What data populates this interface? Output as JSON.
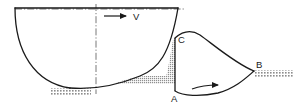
{
  "figure": {
    "labels": {
      "velocity": "V",
      "point_a": "A",
      "point_b": "B",
      "point_c": "C"
    },
    "colors": {
      "stroke": "#1a1a1a",
      "hatch": "#8c8c8c",
      "shade": "#9a9a9a",
      "background": "#ffffff"
    },
    "elements": {
      "vane_name": "curved-vane",
      "centerline_name": "centerline",
      "velocity_arrow_name": "velocity-arrow",
      "flow_arrow_name": "flow-direction-arrow",
      "jet_name": "water-jet",
      "support_left_name": "ground-support-left",
      "support_right_name": "ground-support-right",
      "shaded_jet_name": "jet-cross-section-shading",
      "vertical_ac_name": "segment-a-c"
    }
  }
}
